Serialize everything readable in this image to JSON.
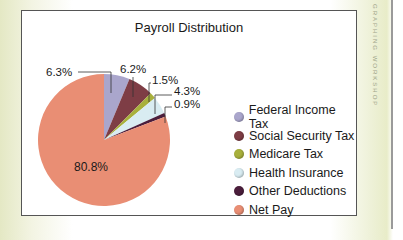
{
  "side_label": "GRAPHING WORKSHOP",
  "chart_data": {
    "type": "pie",
    "title": "Payroll Distribution",
    "categories": [
      "Federal Income Tax",
      "Social Security Tax",
      "Medicare Tax",
      "Health Insurance",
      "Other Deductions",
      "Net Pay"
    ],
    "values": [
      6.3,
      6.2,
      1.5,
      4.3,
      0.9,
      80.8
    ],
    "labels": [
      "6.3%",
      "6.2%",
      "1.5%",
      "4.3%",
      "0.9%",
      "80.8%"
    ],
    "colors": [
      "#aaa6cc",
      "#7e3d45",
      "#a8b03c",
      "#d9ecf2",
      "#4b1e3c",
      "#e98e74"
    ],
    "start_angle": "12 o'clock",
    "direction": "clockwise",
    "legend_position": "right"
  },
  "legend": {
    "items": [
      {
        "label": "Federal Income Tax",
        "color": "#aaa6cc"
      },
      {
        "label": "Social Security Tax",
        "color": "#7e3d45"
      },
      {
        "label": "Medicare Tax",
        "color": "#a8b03c"
      },
      {
        "label": "Health Insurance",
        "color": "#d9ecf2"
      },
      {
        "label": "Other Deductions",
        "color": "#4b1e3c"
      },
      {
        "label": "Net Pay",
        "color": "#e98e74"
      }
    ]
  }
}
